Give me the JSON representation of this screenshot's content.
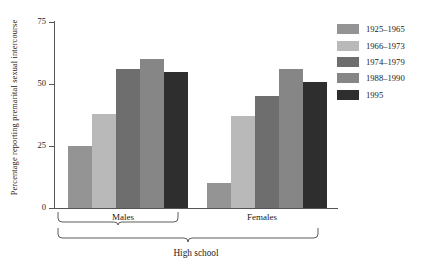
{
  "chart_data": {
    "type": "bar",
    "title": "",
    "xlabel": "High school",
    "ylabel": "Percentage reporting premarital sexual intercourse",
    "ylim": [
      0,
      75
    ],
    "yticks": [
      0,
      25,
      50,
      75
    ],
    "ytick_labels": [
      "0",
      "25",
      "50",
      "75"
    ],
    "grid": false,
    "legend_position": "right",
    "categories": [
      "Males",
      "Females"
    ],
    "group_bracket_label": "High school",
    "series": [
      {
        "name": "1925–1965",
        "color": "#949494",
        "values": [
          25,
          10
        ]
      },
      {
        "name": "1966–1973",
        "color": "#b9b9b9",
        "values": [
          38,
          37
        ]
      },
      {
        "name": "1974–1979",
        "color": "#6e6e6e",
        "values": [
          56,
          45
        ]
      },
      {
        "name": "1988–1990",
        "color": "#868686",
        "values": [
          60,
          56
        ]
      },
      {
        "name": "1995",
        "color": "#2e2e2e",
        "values": [
          55,
          51
        ]
      }
    ]
  },
  "axis": {
    "y_title": "Percentage reporting premarital sexual intercourse",
    "tick_75": "75",
    "tick_50": "50",
    "tick_25": "25",
    "tick_0": "0"
  },
  "groups": {
    "males": "Males",
    "females": "Females",
    "overall": "High school"
  },
  "legend": {
    "items": [
      {
        "label": "1925–1965"
      },
      {
        "label": "1966–1973"
      },
      {
        "label": "1974–1979"
      },
      {
        "label": "1988–1990"
      },
      {
        "label": "1995"
      }
    ]
  }
}
